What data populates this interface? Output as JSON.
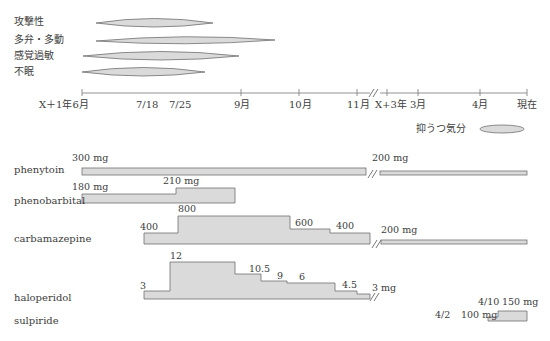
{
  "symptoms": {
    "items": [
      {
        "label": "攻撃性"
      },
      {
        "label": "多弁・多動"
      },
      {
        "label": "感覚過敏"
      },
      {
        "label": "不眠"
      }
    ],
    "depression_label": "抑うつ気分"
  },
  "timeline": {
    "ticks": [
      "X＋1年6月",
      "7/18",
      "7/25",
      "9月",
      "10月",
      "11月",
      "X+3年",
      "3月",
      "4月",
      "現在"
    ],
    "break_marker": "//"
  },
  "drugs": {
    "phenytoin": {
      "name": "phenytoin",
      "doses": [
        "300 mg",
        "200 mg"
      ]
    },
    "phenobarbital": {
      "name": "phenobarbital",
      "doses": [
        "180 mg",
        "210 mg"
      ]
    },
    "carbamazepine": {
      "name": "carbamazepine",
      "doses": [
        "400",
        "800",
        "600",
        "400",
        "200 mg"
      ]
    },
    "haloperidol": {
      "name": "haloperidol",
      "doses": [
        "3",
        "12",
        "10.5",
        "9",
        "6",
        "4.5",
        "3 mg"
      ]
    },
    "sulpiride": {
      "name": "sulpiride",
      "dates": [
        "4/2",
        "4/10"
      ],
      "doses": [
        "100 mg",
        "150 mg"
      ]
    }
  },
  "colors": {
    "fill": "#d9d9d9",
    "stroke": "#6e6e6e",
    "text": "#3c3c3c"
  }
}
